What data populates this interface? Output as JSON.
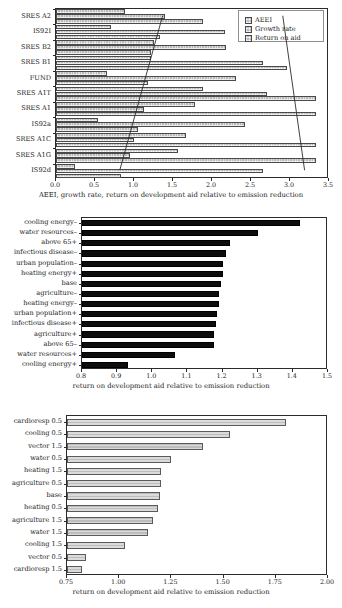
{
  "chart_data": [
    {
      "id": "top",
      "type": "bar",
      "orientation": "horizontal",
      "title": "",
      "xlabel": "AEEI, growth rate, return on development aid relative to emission reduction",
      "ylabel": "",
      "xlim": [
        0.0,
        3.5
      ],
      "xticks": [
        "0.0",
        "0.5",
        "1.0",
        "1.5",
        "2.0",
        "2.5",
        "3.0",
        "3.5"
      ],
      "xtick_values": [
        0.0,
        0.5,
        1.0,
        1.5,
        2.0,
        2.5,
        3.0,
        3.5
      ],
      "grid": false,
      "legend_position": "top-right",
      "legend": [
        "AEEI",
        "Growth rate",
        "Return on aid"
      ],
      "categories": [
        "SRES A2",
        "IS92I",
        "SRES B2",
        "SRES B1",
        "FUND",
        "SRES A1T",
        "SRES A1",
        "IS92a",
        "SRES A1C",
        "SRES A1G",
        "IS92d"
      ],
      "series": [
        {
          "name": "AEEI",
          "values": [
            0.88,
            0.7,
            1.25,
            1.22,
            0.66,
            1.88,
            1.78,
            0.54,
            1.67,
            1.56,
            0.24
          ]
        },
        {
          "name": "Growth rate",
          "values": [
            1.4,
            2.17,
            2.18,
            2.65,
            2.31,
            2.7,
            1.13,
            2.42,
            1.0,
            0.95,
            2.66
          ]
        },
        {
          "name": "Return on aid",
          "values": [
            1.89,
            1.33,
            1.22,
            2.96,
            1.18,
            3.33,
            3.33,
            1.05,
            3.33,
            3.33,
            0.83
          ]
        }
      ],
      "annotation_lines": [
        {
          "name": "growth-rate-trend",
          "x1": 1.38,
          "y1": 0,
          "x2": 0.83,
          "y2": 10
        },
        {
          "name": "return-on-aid-trend",
          "x1": 2.92,
          "y1": 0,
          "x2": 3.2,
          "y2": 10
        }
      ]
    },
    {
      "id": "middle",
      "type": "bar",
      "orientation": "horizontal",
      "title": "",
      "xlabel": "return on development aid relative to emission reduction",
      "ylabel": "",
      "xlim": [
        0.8,
        1.5
      ],
      "xticks": [
        "0.8",
        "0.9",
        "1.0",
        "1.1",
        "1.2",
        "1.3",
        "1.4",
        "1.5"
      ],
      "xtick_values": [
        0.8,
        0.9,
        1.0,
        1.1,
        1.2,
        1.3,
        1.4,
        1.5
      ],
      "grid": false,
      "legend_position": "none",
      "categories": [
        "cooling energy–",
        "water resources–",
        "above 65+",
        "infectious disease–",
        "urban population–",
        "heating energy+",
        "base",
        "agriculture–",
        "heating energy–",
        "urban population+",
        "infectious disease+",
        "agriculture+",
        "above 65–",
        "water resources+",
        "cooling energy+"
      ],
      "values": [
        1.42,
        1.3,
        1.22,
        1.21,
        1.2,
        1.2,
        1.195,
        1.19,
        1.19,
        1.185,
        1.18,
        1.175,
        1.175,
        1.065,
        0.93
      ]
    },
    {
      "id": "bottom",
      "type": "bar",
      "orientation": "horizontal",
      "title": "",
      "xlabel": "return on development aid relative to emission reduction",
      "ylabel": "",
      "xlim": [
        0.75,
        2.0
      ],
      "xticks": [
        "0.75",
        "1.00",
        "1.25",
        "1.50",
        "1.75",
        "2.00"
      ],
      "xtick_values": [
        0.75,
        1.0,
        1.25,
        1.5,
        1.75,
        2.0
      ],
      "grid": false,
      "legend_position": "none",
      "categories": [
        "cardioresp 0.5",
        "cooling 0.5",
        "vector 1.5",
        "water 0.5",
        "heating 1.5",
        "agriculture 0.5",
        "base",
        "heating 0.5",
        "agriculture 1.5",
        "water 1.5",
        "cooling 1.5",
        "vector 0.5",
        "cardioresp 1.5"
      ],
      "values": [
        1.8,
        1.53,
        1.4,
        1.25,
        1.2,
        1.2,
        1.195,
        1.185,
        1.16,
        1.14,
        1.03,
        0.84,
        0.82
      ]
    }
  ],
  "colors": {
    "bar_hatch_fill": "#b9b9b9",
    "bar_hatch_edge": "#4a4a4a",
    "bar_black_fill": "#0d0d0d",
    "axis": "#2b2b2b",
    "background": "#ffffff"
  }
}
